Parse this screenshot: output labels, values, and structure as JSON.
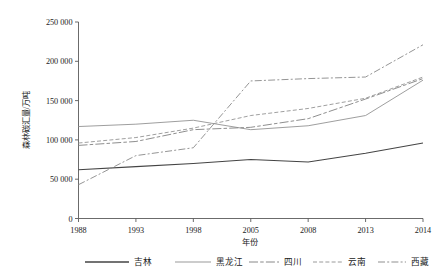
{
  "chart_data": {
    "type": "line",
    "title": "",
    "xlabel": "年份",
    "ylabel": "森林碳汇量/万吨",
    "x": [
      1988,
      1993,
      1998,
      2005,
      2008,
      2013,
      2014
    ],
    "categories": [
      "1988",
      "1993",
      "1998",
      "2005",
      "2008",
      "2013",
      "2014"
    ],
    "xlim": [
      1988,
      2014
    ],
    "ylim": [
      0,
      250000
    ],
    "yticks": [
      0,
      50000,
      100000,
      150000,
      200000,
      250000
    ],
    "ytick_labels": [
      "0",
      "50 000",
      "100 000",
      "150 000",
      "200 000",
      "250 000"
    ],
    "xtick_labels": [
      "1988",
      "1993",
      "1998",
      "2005",
      "2008",
      "2013",
      "2014"
    ],
    "grid": false,
    "legend_position": "bottom",
    "series": [
      {
        "name": "吉林",
        "values": [
          62000,
          66000,
          70000,
          75000,
          72000,
          83000,
          96000
        ],
        "color": "#444444",
        "style": "solid"
      },
      {
        "name": "黑龙江",
        "values": [
          117000,
          120000,
          125000,
          113000,
          118000,
          131000,
          176000
        ],
        "color": "#999999",
        "style": "solid"
      },
      {
        "name": "四川",
        "values": [
          93000,
          98000,
          113000,
          116000,
          127000,
          152000,
          178000
        ],
        "color": "#888888",
        "style": "long-dash-dash"
      },
      {
        "name": "云南",
        "values": [
          96000,
          103000,
          115000,
          131000,
          140000,
          153000,
          180000
        ],
        "color": "#9a9a9a",
        "style": "dashed"
      },
      {
        "name": "西藏",
        "values": [
          43000,
          80000,
          90000,
          175000,
          178000,
          180000,
          221000
        ],
        "color": "#8f8f8f",
        "style": "dash-dot"
      }
    ]
  },
  "legend": {
    "items": [
      {
        "label": "吉林"
      },
      {
        "label": "黑龙江"
      },
      {
        "label": "四川"
      },
      {
        "label": "云南"
      },
      {
        "label": "西藏"
      }
    ]
  },
  "axes": {
    "x_title": "年份",
    "y_title": "森林碳汇量/万吨"
  }
}
